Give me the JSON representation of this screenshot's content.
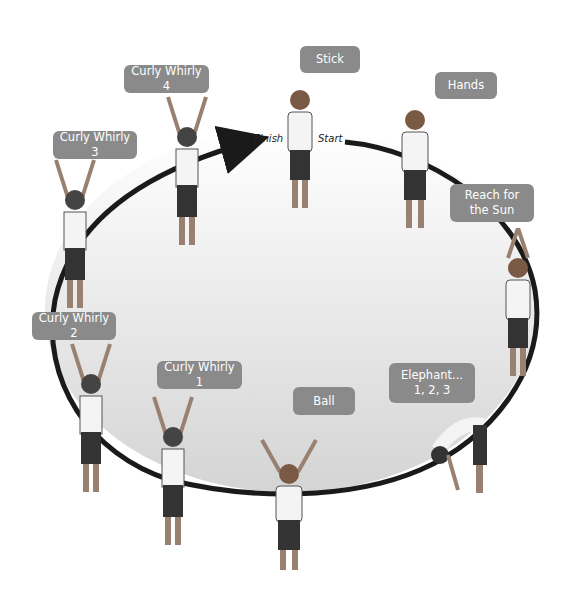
{
  "diagram": {
    "title": "",
    "sequence_direction": "clockwise from Start to Finish",
    "markers": {
      "start": "Start",
      "finish": "Finish"
    },
    "colors": {
      "bubble": "#8a8a8a",
      "bubble_text": "#ffffff",
      "path": "#1a1a1a",
      "fill_top": "#ffffff",
      "fill_bottom": "#d8d8d8"
    },
    "poses": [
      {
        "order": 1,
        "label": "Stick"
      },
      {
        "order": 2,
        "label": "Hands"
      },
      {
        "order": 3,
        "label_line1": "Reach for",
        "label_line2": "the Sun"
      },
      {
        "order": 4,
        "label_line1": "Elephant...",
        "label_line2": "1, 2, 3"
      },
      {
        "order": 5,
        "label": "Ball"
      },
      {
        "order": 6,
        "label": "Curly Whirly 1"
      },
      {
        "order": 7,
        "label": "Curly Whirly 2"
      },
      {
        "order": 8,
        "label": "Curly Whirly 3"
      },
      {
        "order": 9,
        "label": "Curly Whirly 4"
      }
    ]
  }
}
